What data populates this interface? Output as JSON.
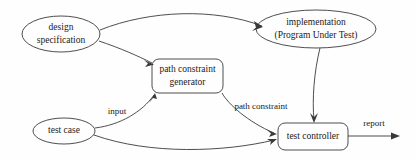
{
  "diagram": {
    "background_color": "#fefefe",
    "stroke_color": "#3a3a3a",
    "text_color": "#1a1a1a",
    "nodes": [
      {
        "id": "design-specification",
        "shape": "ellipse",
        "lines": [
          "design",
          "specification"
        ],
        "line1": "design",
        "line2": "specification"
      },
      {
        "id": "implementation",
        "shape": "ellipse",
        "lines": [
          "implementation",
          "(Program Under Test)"
        ],
        "line1": "implementation",
        "line2": "(Program Under Test)"
      },
      {
        "id": "path-constraint-generator",
        "shape": "rounded-rectangle",
        "lines": [
          "path constraint",
          "generator"
        ],
        "line1": "path constraint",
        "line2": "generator"
      },
      {
        "id": "test-case",
        "shape": "ellipse",
        "lines": [
          "test case"
        ],
        "line1": "test case"
      },
      {
        "id": "test-controller",
        "shape": "rounded-rectangle",
        "lines": [
          "test controller"
        ],
        "line1": "test controller"
      }
    ],
    "edges": [
      {
        "id": "design-to-implementation",
        "from": "design-specification",
        "to": "implementation",
        "label": ""
      },
      {
        "id": "design-to-generator",
        "from": "design-specification",
        "to": "path-constraint-generator",
        "label": ""
      },
      {
        "id": "testcase-to-generator",
        "from": "test-case",
        "to": "path-constraint-generator",
        "label": "input"
      },
      {
        "id": "generator-to-controller",
        "from": "path-constraint-generator",
        "to": "test-controller",
        "label": "path constraint"
      },
      {
        "id": "implementation-to-controller",
        "from": "implementation",
        "to": "test-controller",
        "label": ""
      },
      {
        "id": "testcase-to-controller",
        "from": "test-case",
        "to": "test-controller",
        "label": ""
      },
      {
        "id": "controller-to-report",
        "from": "test-controller",
        "to": "output",
        "label": "report"
      }
    ]
  }
}
